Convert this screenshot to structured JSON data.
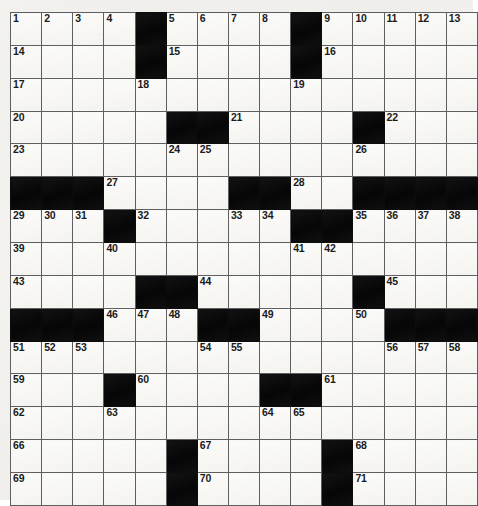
{
  "puzzle": {
    "type": "crossword-grid",
    "rows": 15,
    "cols": 15,
    "colors": {
      "paper": "#f3f2ee",
      "cell": "#f7f6f2",
      "block": "#0c0c0c",
      "gridline": "#5d5f61",
      "number": "#1b1b1b"
    },
    "black_squares": [
      [
        0,
        4
      ],
      [
        0,
        9
      ],
      [
        1,
        4
      ],
      [
        1,
        9
      ],
      [
        3,
        5
      ],
      [
        3,
        6
      ],
      [
        3,
        11
      ],
      [
        5,
        0
      ],
      [
        5,
        1
      ],
      [
        5,
        2
      ],
      [
        5,
        7
      ],
      [
        5,
        8
      ],
      [
        5,
        11
      ],
      [
        5,
        12
      ],
      [
        5,
        13
      ],
      [
        5,
        14
      ],
      [
        6,
        3
      ],
      [
        6,
        9
      ],
      [
        6,
        10
      ],
      [
        8,
        4
      ],
      [
        8,
        5
      ],
      [
        8,
        11
      ],
      [
        9,
        0
      ],
      [
        9,
        1
      ],
      [
        9,
        2
      ],
      [
        9,
        6
      ],
      [
        9,
        7
      ],
      [
        9,
        12
      ],
      [
        9,
        13
      ],
      [
        9,
        14
      ],
      [
        11,
        3
      ],
      [
        11,
        8
      ],
      [
        11,
        9
      ],
      [
        13,
        5
      ],
      [
        13,
        10
      ],
      [
        14,
        5
      ],
      [
        14,
        10
      ]
    ],
    "numbers": [
      {
        "row": 0,
        "col": 0,
        "n": "1"
      },
      {
        "row": 0,
        "col": 1,
        "n": "2"
      },
      {
        "row": 0,
        "col": 2,
        "n": "3"
      },
      {
        "row": 0,
        "col": 3,
        "n": "4"
      },
      {
        "row": 0,
        "col": 5,
        "n": "5"
      },
      {
        "row": 0,
        "col": 6,
        "n": "6"
      },
      {
        "row": 0,
        "col": 7,
        "n": "7"
      },
      {
        "row": 0,
        "col": 8,
        "n": "8"
      },
      {
        "row": 0,
        "col": 10,
        "n": "9"
      },
      {
        "row": 0,
        "col": 11,
        "n": "10"
      },
      {
        "row": 0,
        "col": 12,
        "n": "11"
      },
      {
        "row": 0,
        "col": 13,
        "n": "12"
      },
      {
        "row": 0,
        "col": 14,
        "n": "13"
      },
      {
        "row": 1,
        "col": 0,
        "n": "14"
      },
      {
        "row": 1,
        "col": 5,
        "n": "15"
      },
      {
        "row": 1,
        "col": 10,
        "n": "16"
      },
      {
        "row": 2,
        "col": 0,
        "n": "17"
      },
      {
        "row": 2,
        "col": 4,
        "n": "18"
      },
      {
        "row": 2,
        "col": 9,
        "n": "19"
      },
      {
        "row": 3,
        "col": 0,
        "n": "20"
      },
      {
        "row": 3,
        "col": 7,
        "n": "21"
      },
      {
        "row": 3,
        "col": 12,
        "n": "22"
      },
      {
        "row": 4,
        "col": 0,
        "n": "23"
      },
      {
        "row": 4,
        "col": 5,
        "n": "24"
      },
      {
        "row": 4,
        "col": 6,
        "n": "25"
      },
      {
        "row": 4,
        "col": 11,
        "n": "26"
      },
      {
        "row": 5,
        "col": 3,
        "n": "27"
      },
      {
        "row": 5,
        "col": 9,
        "n": "28"
      },
      {
        "row": 6,
        "col": 0,
        "n": "29"
      },
      {
        "row": 6,
        "col": 1,
        "n": "30"
      },
      {
        "row": 6,
        "col": 2,
        "n": "31"
      },
      {
        "row": 6,
        "col": 4,
        "n": "32"
      },
      {
        "row": 6,
        "col": 7,
        "n": "33"
      },
      {
        "row": 6,
        "col": 8,
        "n": "34"
      },
      {
        "row": 6,
        "col": 11,
        "n": "35"
      },
      {
        "row": 6,
        "col": 12,
        "n": "36"
      },
      {
        "row": 6,
        "col": 13,
        "n": "37"
      },
      {
        "row": 6,
        "col": 14,
        "n": "38"
      },
      {
        "row": 7,
        "col": 0,
        "n": "39"
      },
      {
        "row": 7,
        "col": 3,
        "n": "40"
      },
      {
        "row": 7,
        "col": 9,
        "n": "41"
      },
      {
        "row": 7,
        "col": 10,
        "n": "42"
      },
      {
        "row": 8,
        "col": 0,
        "n": "43"
      },
      {
        "row": 8,
        "col": 6,
        "n": "44"
      },
      {
        "row": 8,
        "col": 12,
        "n": "45"
      },
      {
        "row": 9,
        "col": 3,
        "n": "46"
      },
      {
        "row": 9,
        "col": 4,
        "n": "47"
      },
      {
        "row": 9,
        "col": 5,
        "n": "48"
      },
      {
        "row": 9,
        "col": 8,
        "n": "49"
      },
      {
        "row": 9,
        "col": 11,
        "n": "50"
      },
      {
        "row": 10,
        "col": 0,
        "n": "51"
      },
      {
        "row": 10,
        "col": 1,
        "n": "52"
      },
      {
        "row": 10,
        "col": 2,
        "n": "53"
      },
      {
        "row": 10,
        "col": 6,
        "n": "54"
      },
      {
        "row": 10,
        "col": 7,
        "n": "55"
      },
      {
        "row": 10,
        "col": 12,
        "n": "56"
      },
      {
        "row": 10,
        "col": 13,
        "n": "57"
      },
      {
        "row": 10,
        "col": 14,
        "n": "58"
      },
      {
        "row": 11,
        "col": 0,
        "n": "59"
      },
      {
        "row": 11,
        "col": 4,
        "n": "60"
      },
      {
        "row": 11,
        "col": 10,
        "n": "61"
      },
      {
        "row": 12,
        "col": 0,
        "n": "62"
      },
      {
        "row": 12,
        "col": 3,
        "n": "63"
      },
      {
        "row": 12,
        "col": 8,
        "n": "64"
      },
      {
        "row": 12,
        "col": 9,
        "n": "65"
      },
      {
        "row": 13,
        "col": 0,
        "n": "66"
      },
      {
        "row": 13,
        "col": 6,
        "n": "67"
      },
      {
        "row": 13,
        "col": 11,
        "n": "68"
      },
      {
        "row": 14,
        "col": 0,
        "n": "69"
      },
      {
        "row": 14,
        "col": 6,
        "n": "70"
      },
      {
        "row": 14,
        "col": 11,
        "n": "71"
      }
    ]
  }
}
